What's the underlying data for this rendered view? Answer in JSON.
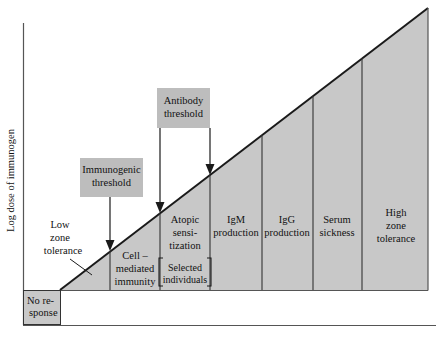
{
  "figure": {
    "axis": {
      "y_label": "Log dose of immunogen"
    },
    "no_response": {
      "line1": "No re-",
      "line2": "sponse"
    },
    "annotations": [
      {
        "name": "low-zone-tolerance",
        "line1": "Low",
        "line2": "zone",
        "line3": "tolerance"
      }
    ],
    "callouts": [
      {
        "name": "immunogenic-threshold",
        "line1": "Immunogenic",
        "line2": "threshold"
      },
      {
        "name": "antibody-threshold",
        "line1": "Antibody",
        "line2": "threshold"
      }
    ],
    "bracket": {
      "line1": "Selected",
      "line2": "individuals"
    },
    "zones": [
      {
        "name": "cell-mediated-immunity",
        "line1": "Cell –",
        "line2": "mediated",
        "line3": "immunity"
      },
      {
        "name": "atopic-sensitization",
        "line1": "Atopic",
        "line2": "sensi-",
        "line3": "tization"
      },
      {
        "name": "igm-production",
        "line1": "IgM",
        "line2": "production",
        "line3": ""
      },
      {
        "name": "igg-production",
        "line1": "IgG",
        "line2": "production",
        "line3": ""
      },
      {
        "name": "serum-sickness",
        "line1": "Serum",
        "line2": "sickness",
        "line3": ""
      },
      {
        "name": "high-zone-tolerance",
        "line1": "High",
        "line2": "zone",
        "line3": "tolerance"
      }
    ],
    "colors": {
      "wedge_fill": "#c8c8c8",
      "callout_fill": "#bdbdbd",
      "noresponse_fill": "#c8c8c8",
      "line": "#1a1a1a",
      "text": "#111111"
    }
  }
}
